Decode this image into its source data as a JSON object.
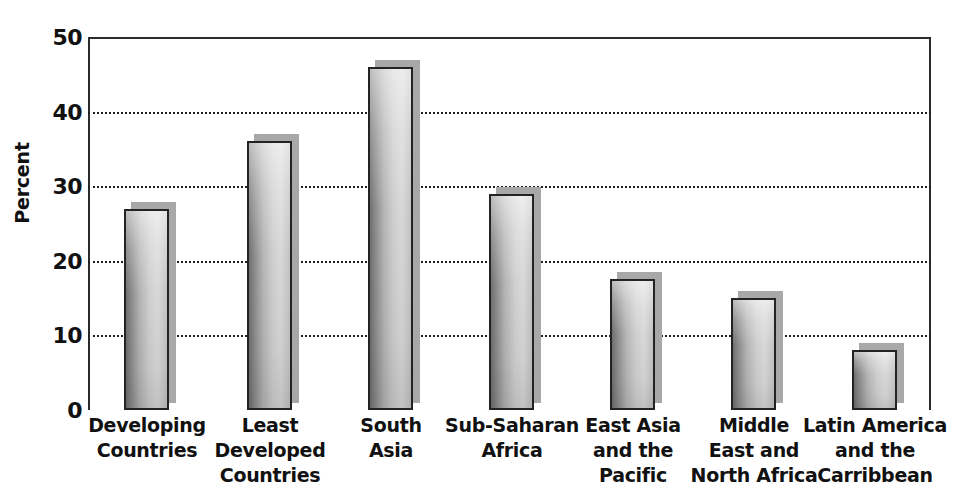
{
  "chart_data": {
    "type": "bar",
    "title": "",
    "xlabel": "",
    "ylabel": "Percent",
    "ylim": [
      0,
      50
    ],
    "yticks": [
      0,
      10,
      20,
      30,
      40,
      50
    ],
    "ytick_labels": [
      "0",
      "10",
      "20",
      "30",
      "40",
      "50"
    ],
    "grid": "horizontal-dotted",
    "legend": "none",
    "categories": [
      "Developing Countries",
      "Least Developed Countries",
      "South Asia",
      "Sub-Saharan Africa",
      "East Asia and the Pacific",
      "Middle East and North Africa",
      "Latin America and the Carribbean"
    ],
    "category_lines": [
      [
        "Developing",
        "Countries"
      ],
      [
        "Least",
        "Developed",
        "Countries"
      ],
      [
        "South",
        "Asia"
      ],
      [
        "Sub-Saharan",
        "Africa"
      ],
      [
        "East Asia",
        "and the",
        "Pacific"
      ],
      [
        "Middle",
        "East and",
        "North Africa"
      ],
      [
        "Latin America",
        "and the",
        "Carribbean"
      ]
    ],
    "values": [
      27,
      36,
      46,
      29,
      17.5,
      15,
      8
    ],
    "colors": {
      "bar_fill_light": "#d8d8d8",
      "bar_fill_dark": "#6f6f6f",
      "bar_border": "#232323",
      "bar_shadow": "#a8a8a8",
      "axis": "#2b2b2b",
      "gridline": "#1e1e1e",
      "text": "#111111",
      "background": "#ffffff"
    }
  }
}
